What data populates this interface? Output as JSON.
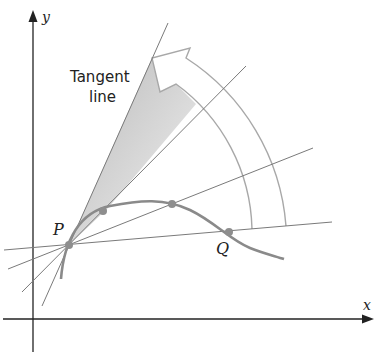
{
  "diagram": {
    "axes": {
      "x_label": "x",
      "y_label": "y"
    },
    "labels": {
      "tangent_line_1": "Tangent",
      "tangent_line_2": "line",
      "point_p": "P",
      "point_q": "Q"
    },
    "points": [
      {
        "name": "P",
        "x": 69,
        "y": 245
      },
      {
        "name": "secant-point-3",
        "x": 103,
        "y": 211
      },
      {
        "name": "secant-point-2",
        "x": 172,
        "y": 204
      },
      {
        "name": "Q",
        "x": 229,
        "y": 232
      }
    ],
    "colors": {
      "axis": "#222222",
      "curve": "#8a8a8a",
      "secant_lines": "#7a7a7a",
      "arrow_outline": "#a8a8a8",
      "shade_dark": "#bdbdbd",
      "shade_light": "#f4f4f4",
      "point_fill": "#8e8e8e",
      "text": "#222222"
    }
  }
}
